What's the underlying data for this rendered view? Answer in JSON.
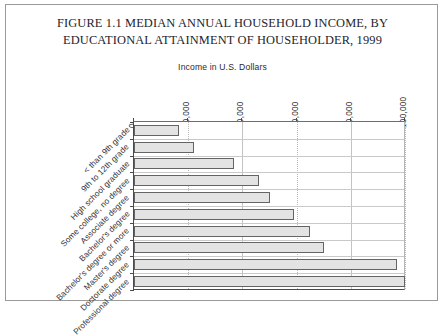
{
  "figure": {
    "title_line_1": "FIGURE 1.1  MEDIAN ANNUAL HOUSEHOLD INCOME, BY",
    "title_line_2": "EDUCATIONAL ATTAINMENT OF HOUSEHOLDER, 1999",
    "axis_title": "Income in U.S. Dollars"
  },
  "chart_data": {
    "type": "bar",
    "orientation": "horizontal",
    "title": "FIGURE 1.1  MEDIAN ANNUAL HOUSEHOLD INCOME, BY EDUCATIONAL ATTAINMENT OF HOUSEHOLDER, 1999",
    "xlabel": "Income in U.S. Dollars",
    "ylabel": "",
    "xlim": [
      0,
      100000
    ],
    "grid": true,
    "legend": null,
    "xticks": [
      "0",
      "20,000",
      "40,000",
      "60,000",
      "80,000",
      "100,000"
    ],
    "xtick_values": [
      0,
      20000,
      40000,
      60000,
      80000,
      100000
    ],
    "categories": [
      "< than 9th grade",
      "9th to 12th grade",
      "High school graduate",
      "Some college, no degree",
      "Associate degree",
      "Bachelor's degree",
      "Bachelor's degree or more",
      "Master's degree",
      "Doctorate degree",
      "Professional degree"
    ],
    "values": [
      16500,
      22000,
      37000,
      46000,
      50000,
      59000,
      65000,
      70000,
      97000,
      100000
    ]
  },
  "colors": {
    "bar_fill": "#e3e3e3",
    "bar_border": "#646464",
    "frame": "#9a9a9a",
    "axis": "#4a4a4a",
    "grid": "#c3c3c3",
    "text": "#24242c"
  }
}
